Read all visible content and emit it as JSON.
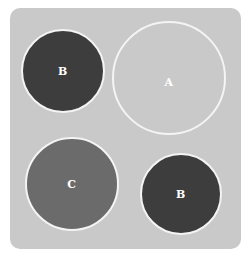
{
  "diagram": {
    "colors": {
      "background": "#ffffff",
      "panel": "#c9c9c9",
      "outline": "#f4f4f4",
      "dark": "#3d3d3d",
      "medium": "#6b6b6b",
      "label": "#ffffff"
    },
    "circles": [
      {
        "label": "B",
        "cx": 63,
        "cy": 71,
        "r": 42,
        "fill": "#3d3d3d"
      },
      {
        "label": "A",
        "cx": 169,
        "cy": 78,
        "r": 57,
        "fill": "#c9c9c9"
      },
      {
        "label": "C",
        "cx": 72,
        "cy": 184,
        "r": 47,
        "fill": "#6b6b6b"
      },
      {
        "label": "B",
        "cx": 181,
        "cy": 194,
        "r": 41,
        "fill": "#3d3d3d"
      }
    ]
  }
}
